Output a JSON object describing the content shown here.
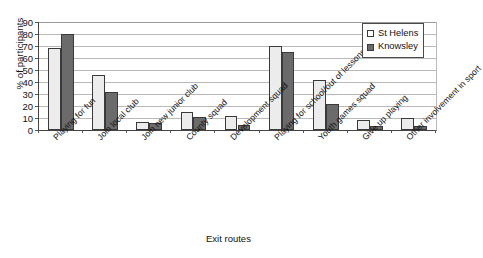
{
  "chart_data": {
    "type": "bar",
    "title": "",
    "xlabel": "Exit routes",
    "ylabel": "% of participants",
    "ylim": [
      0,
      90
    ],
    "ytick_step": 10,
    "yticks": [
      0,
      10,
      20,
      30,
      40,
      50,
      60,
      70,
      80,
      90
    ],
    "grid": true,
    "legend_position": "top-right",
    "categories": [
      "Playing for fun",
      "Join local club",
      "Join new junior club",
      "County squad",
      "Development squad",
      "Playing for school/out of lessons",
      "Youth games squad",
      "Give up playing",
      "Other involvement in sport"
    ],
    "series": [
      {
        "name": "St Helens",
        "color": "#ececec",
        "values": [
          68,
          46,
          7,
          15,
          12,
          70,
          42,
          8,
          10
        ]
      },
      {
        "name": "Knowsley",
        "color": "#6b6b6b",
        "values": [
          80,
          32,
          6,
          11,
          4,
          65,
          22,
          3,
          3
        ]
      }
    ]
  },
  "legend": {
    "items": [
      {
        "label": "St Helens"
      },
      {
        "label": "Knowsley"
      }
    ]
  }
}
